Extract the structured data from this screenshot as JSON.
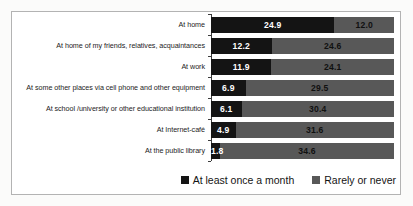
{
  "chart_data": {
    "type": "bar",
    "orientation": "horizontal",
    "stacked": true,
    "title": "",
    "xlabel": "",
    "ylabel": "",
    "xlim": [
      0,
      37
    ],
    "grid": false,
    "legend_position": "bottom-right",
    "value_labels": "inside-segments",
    "categories": [
      "At home",
      "At home of my friends, relatives, acquaintances",
      "At work",
      "At some other places via cell phone and other equipment",
      "At school /university or other educational institution",
      "At Internet-café",
      "At the public library"
    ],
    "series": [
      {
        "name": "At least once a month",
        "color": "#141414",
        "label_color": "#ffffff",
        "values": [
          24.9,
          12.2,
          11.9,
          6.9,
          6.1,
          4.9,
          1.8
        ],
        "labels": [
          "24.9",
          "12.2",
          "11.9",
          "6.9",
          "6.1",
          "4.9",
          "1.8"
        ]
      },
      {
        "name": "Rarely or never",
        "color": "#585858",
        "label_color": "#101010",
        "values": [
          12.0,
          24.6,
          24.1,
          29.5,
          30.4,
          31.6,
          34.6
        ],
        "labels": [
          "12.0",
          "24.6",
          "24.1",
          "29.5",
          "30.4",
          "31.6",
          "34.6"
        ]
      }
    ]
  }
}
